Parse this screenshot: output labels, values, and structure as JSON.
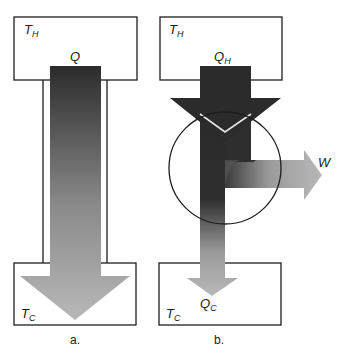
{
  "diagram_a": {
    "hot_reservoir_label": "T",
    "hot_reservoir_sub": "H",
    "cold_reservoir_label": "T",
    "cold_reservoir_sub": "C",
    "heat_flow_label": "Q",
    "caption": "a."
  },
  "diagram_b": {
    "hot_reservoir_label": "T",
    "hot_reservoir_sub": "H",
    "cold_reservoir_label": "T",
    "cold_reservoir_sub": "C",
    "heat_in_label": "Q",
    "heat_in_sub": "H",
    "heat_out_label": "Q",
    "heat_out_sub": "C",
    "work_label": "W",
    "caption": "b."
  },
  "colors": {
    "dark": "#2a2a2a",
    "light": "#b4b4b4",
    "outline": "#1e1e1e"
  }
}
